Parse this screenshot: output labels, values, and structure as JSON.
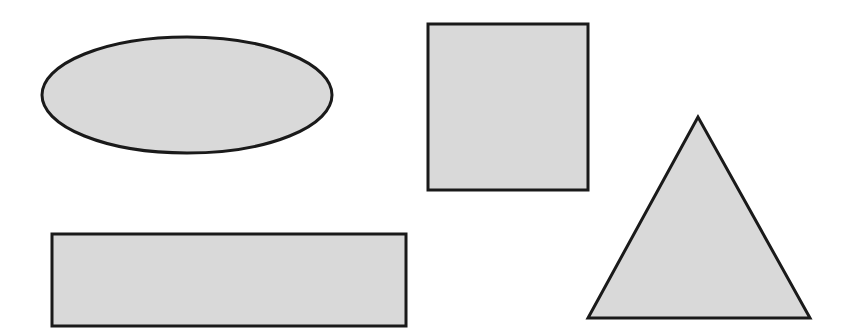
{
  "canvas": {
    "width": 845,
    "height": 331,
    "background": "#ffffff"
  },
  "style": {
    "fill": "#d9d9d9",
    "stroke": "#1a1a1a",
    "stroke_width": 3
  },
  "shapes": [
    {
      "type": "ellipse",
      "name": "ellipse",
      "cx": 187,
      "cy": 95,
      "rx": 145,
      "ry": 58
    },
    {
      "type": "square",
      "name": "square",
      "x": 428,
      "y": 24,
      "width": 160,
      "height": 166
    },
    {
      "type": "rectangle",
      "name": "rectangle",
      "x": 52,
      "y": 234,
      "width": 354,
      "height": 92
    },
    {
      "type": "triangle",
      "name": "triangle",
      "points": [
        [
          698,
          117
        ],
        [
          588,
          318
        ],
        [
          810,
          318
        ]
      ]
    }
  ]
}
